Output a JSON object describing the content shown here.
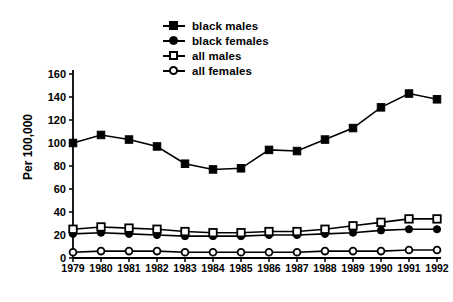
{
  "chart_data": {
    "type": "line",
    "title": "",
    "xlabel": "",
    "ylabel": "Per 100,000",
    "x": [
      1979,
      1980,
      1981,
      1982,
      1983,
      1984,
      1985,
      1986,
      1987,
      1988,
      1989,
      1990,
      1991,
      1992
    ],
    "xticklabels": [
      "1979",
      "1980",
      "1981",
      "1982",
      "1983",
      "1984",
      "1985",
      "1986",
      "1987",
      "1988",
      "1989",
      "1990",
      "1991",
      "1992"
    ],
    "yticks": [
      0,
      20,
      40,
      60,
      80,
      100,
      120,
      140,
      160
    ],
    "yticklabels": [
      "0",
      "20",
      "40",
      "60",
      "80",
      "100",
      "120",
      "140",
      "160"
    ],
    "ylim": [
      0,
      165
    ],
    "xlim": [
      1978.6,
      1992.6
    ],
    "grid": false,
    "legend_position": "top-center",
    "series": [
      {
        "name": "black males",
        "marker": "filled-square",
        "values": [
          100,
          107,
          103,
          97,
          82,
          77,
          78,
          94,
          93,
          103,
          113,
          131,
          143,
          138
        ]
      },
      {
        "name": "black females",
        "marker": "filled-circle",
        "values": [
          21,
          22,
          21,
          20,
          19,
          19,
          19,
          20,
          20,
          21,
          22,
          24,
          25,
          25
        ]
      },
      {
        "name": "all males",
        "marker": "open-square",
        "values": [
          25,
          27,
          26,
          25,
          23,
          22,
          22,
          23,
          23,
          25,
          28,
          31,
          34,
          34
        ]
      },
      {
        "name": "all females",
        "marker": "open-circle",
        "values": [
          5,
          6,
          6,
          6,
          5,
          5,
          5,
          5,
          5,
          6,
          6,
          6,
          7,
          7
        ]
      }
    ]
  },
  "legend": {
    "items": [
      {
        "label": "black males",
        "marker": "filled-square"
      },
      {
        "label": "black females",
        "marker": "filled-circle"
      },
      {
        "label": "all males",
        "marker": "open-square"
      },
      {
        "label": "all females",
        "marker": "open-circle"
      }
    ]
  },
  "axes": {
    "ylabel": "Per 100,000"
  }
}
